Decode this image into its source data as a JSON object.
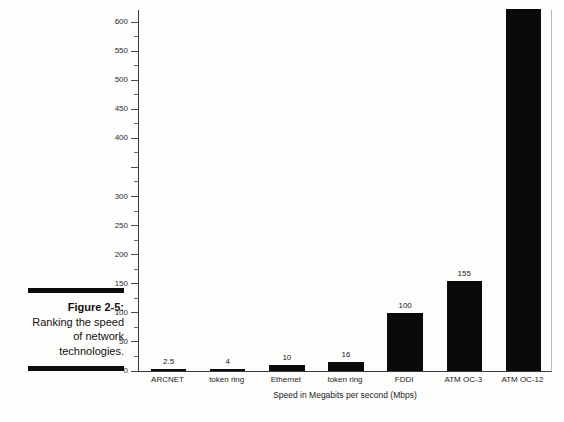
{
  "caption": {
    "figure_number": "Figure 2-5:",
    "body": "Ranking the speed of network technologies."
  },
  "chart_data": {
    "type": "bar",
    "title": "",
    "xlabel": "Speed in Megabits per second (Mbps)",
    "ylabel": "",
    "categories": [
      "ARCNET",
      "token ring",
      "Ethernet",
      "token ring",
      "FDDI",
      "ATM OC-3",
      "ATM OC-12"
    ],
    "values": [
      2.5,
      4,
      10,
      16,
      100,
      155,
      622
    ],
    "value_labels": [
      "2.5",
      "4",
      "10",
      "16",
      "100",
      "155",
      ""
    ],
    "ylim": [
      0,
      622
    ],
    "y_axis_max_tick": 600,
    "y_ticks": [
      0,
      50,
      100,
      150,
      200,
      250,
      300,
      350,
      400,
      450,
      500,
      550,
      600
    ],
    "y_tick_labels": [
      "0",
      "50",
      "100",
      "150",
      "200",
      "250",
      "300",
      "",
      "400",
      "450",
      "500",
      "550",
      "600"
    ],
    "y_minor_ticks": [
      25,
      75,
      125,
      175,
      225,
      275,
      325,
      375,
      425,
      475,
      525,
      575
    ],
    "grid": false,
    "legend": null,
    "bar_color": "#0a0a0a",
    "axis_color": "#3a3a3a"
  }
}
